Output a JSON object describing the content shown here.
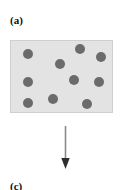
{
  "figure": {
    "panel_label_top": "(a)",
    "panel_label_bottom": "(c)",
    "box": {
      "fill_color": "#e3e3e3",
      "border_color": "#cfcfcf",
      "x": 10,
      "y": 40,
      "width": 103,
      "height": 73
    },
    "particles": {
      "count": 11,
      "color": "#6b6b6b",
      "diameter": 10,
      "positions": [
        {
          "x": 12,
          "y": 8
        },
        {
          "x": 44,
          "y": 18
        },
        {
          "x": 64,
          "y": 3
        },
        {
          "x": 85,
          "y": 11
        },
        {
          "x": 12,
          "y": 36
        },
        {
          "x": 58,
          "y": 34
        },
        {
          "x": 83,
          "y": 36
        },
        {
          "x": 12,
          "y": 57
        },
        {
          "x": 37,
          "y": 53
        },
        {
          "x": 71,
          "y": 58
        },
        {
          "x": 30,
          "y": 0
        }
      ]
    },
    "arrow": {
      "name": "downward-arrow",
      "color": "#808080",
      "direction": "down"
    }
  }
}
